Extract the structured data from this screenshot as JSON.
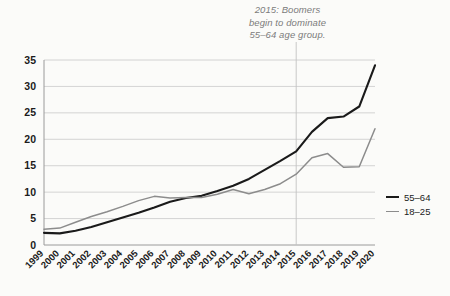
{
  "annotation": {
    "text": "2015: Boomers\nbegin to dominate\n55–64 age group.",
    "marker_year": 2015,
    "color": "#7c7c7c"
  },
  "legend": {
    "position": "right",
    "items": [
      {
        "label": "55–64",
        "color": "#1a1a1a"
      },
      {
        "label": "18–25",
        "color": "#8c8c8c"
      }
    ]
  },
  "chart_data": {
    "type": "line",
    "title": "",
    "xlabel": "",
    "ylabel": "",
    "ylim": [
      0,
      35
    ],
    "ytick_labels": [
      "0",
      "5",
      "10",
      "15",
      "20",
      "25",
      "30",
      "35"
    ],
    "ytick_values": [
      0,
      5,
      10,
      15,
      20,
      25,
      30,
      35
    ],
    "grid": true,
    "grid_axis": "y",
    "categories": [
      "1999",
      "2000",
      "2001",
      "2002",
      "2003",
      "2004",
      "2005",
      "2006",
      "2007",
      "2008",
      "2009",
      "2010",
      "2011",
      "2012",
      "2013",
      "2014",
      "2015",
      "2016",
      "2017",
      "2018",
      "2019",
      "2020"
    ],
    "series": [
      {
        "name": "55–64",
        "color": "#1a1a1a",
        "values": [
          2.3,
          2.2,
          2.7,
          3.4,
          4.3,
          5.2,
          6.1,
          7.1,
          8.2,
          8.9,
          9.3,
          10.2,
          11.2,
          12.5,
          14.2,
          15.9,
          17.7,
          21.4,
          24.0,
          24.3,
          26.2,
          34.0
        ]
      },
      {
        "name": "18–25",
        "color": "#8c8c8c",
        "values": [
          3.0,
          3.2,
          4.3,
          5.4,
          6.3,
          7.3,
          8.4,
          9.2,
          8.9,
          9.0,
          9.0,
          9.6,
          10.5,
          9.7,
          10.5,
          11.6,
          13.4,
          16.5,
          17.3,
          14.7,
          14.8,
          22.0
        ]
      }
    ]
  }
}
